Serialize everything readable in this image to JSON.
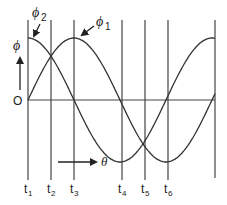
{
  "diagram": {
    "title": "",
    "axis": {
      "origin_label": "O",
      "y_label": "ϕ",
      "x_label": "θ"
    },
    "curves": [
      {
        "name": "ϕ1",
        "label": "ϕ",
        "subscript": "1",
        "phase": "lags ϕ2 by 90°",
        "peak_at": "t3"
      },
      {
        "name": "ϕ2",
        "label": "ϕ",
        "subscript": "2",
        "phase": "leads ϕ1 by 90°",
        "peak_at": "t1"
      }
    ],
    "time_markers": [
      {
        "label": "t",
        "subscript": "1"
      },
      {
        "label": "t",
        "subscript": "2"
      },
      {
        "label": "t",
        "subscript": "3"
      },
      {
        "label": "t",
        "subscript": "4"
      },
      {
        "label": "t",
        "subscript": "5"
      },
      {
        "label": "t",
        "subscript": "6"
      }
    ],
    "colors": {
      "line": "#333333",
      "background": "#ffffff"
    }
  }
}
